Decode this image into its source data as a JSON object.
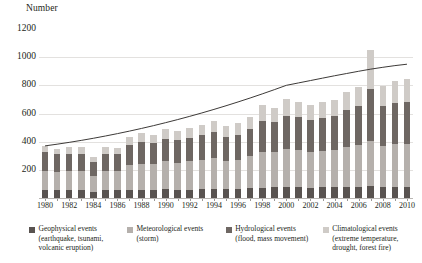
{
  "chart_data": {
    "type": "bar",
    "stacked": true,
    "title": "",
    "ylabel": "Number",
    "xlabel": "",
    "ylim": [
      0,
      1200
    ],
    "yticks": [
      200,
      400,
      600,
      800,
      1000,
      1200
    ],
    "grid": true,
    "legend_position": "bottom",
    "categories": [
      1980,
      1981,
      1982,
      1983,
      1984,
      1985,
      1986,
      1987,
      1988,
      1989,
      1990,
      1991,
      1992,
      1993,
      1994,
      1995,
      1996,
      1997,
      1998,
      1999,
      2000,
      2001,
      2002,
      2003,
      2004,
      2005,
      2006,
      2007,
      2008,
      2009,
      2010
    ],
    "xtick_labels": [
      "1980",
      "",
      "1982",
      "",
      "1984",
      "",
      "1986",
      "",
      "1988",
      "",
      "1990",
      "",
      "1992",
      "",
      "1994",
      "",
      "1996",
      "",
      "1998",
      "",
      "2000",
      "",
      "2002",
      "",
      "2004",
      "",
      "2006",
      "",
      "2008",
      "",
      "2010"
    ],
    "series": [
      {
        "name": "Geophysical events",
        "color": "#595350",
        "values": [
          60,
          55,
          55,
          55,
          45,
          55,
          55,
          60,
          55,
          60,
          65,
          60,
          60,
          65,
          65,
          65,
          65,
          70,
          70,
          75,
          75,
          75,
          70,
          75,
          75,
          80,
          80,
          85,
          80,
          80,
          80
        ]
      },
      {
        "name": "Meteorological events",
        "color": "#b5b0ac",
        "values": [
          135,
          130,
          140,
          140,
          110,
          140,
          135,
          175,
          185,
          180,
          200,
          190,
          200,
          205,
          220,
          200,
          205,
          225,
          255,
          250,
          270,
          265,
          255,
          260,
          265,
          280,
          295,
          320,
          290,
          300,
          305
        ]
      },
      {
        "name": "Hydrological events",
        "color": "#6e6763",
        "values": [
          130,
          125,
          120,
          115,
          100,
          115,
          120,
          140,
          155,
          150,
          155,
          160,
          165,
          175,
          185,
          170,
          180,
          195,
          225,
          215,
          240,
          235,
          230,
          235,
          240,
          265,
          280,
          370,
          280,
          295,
          300
        ]
      },
      {
        "name": "Climatological events",
        "color": "#cfcbc7",
        "values": [
          45,
          40,
          45,
          50,
          35,
          50,
          45,
          55,
          65,
          60,
          70,
          65,
          70,
          75,
          80,
          75,
          80,
          85,
          110,
          100,
          115,
          110,
          105,
          110,
          115,
          125,
          130,
          275,
          145,
          155,
          160
        ]
      }
    ],
    "totals": [
      370,
      350,
      360,
      360,
      290,
      360,
      355,
      430,
      460,
      450,
      490,
      475,
      495,
      520,
      550,
      510,
      530,
      575,
      660,
      640,
      700,
      685,
      660,
      680,
      695,
      750,
      785,
      1050,
      795,
      830,
      845
    ],
    "trendline": {
      "name": "trend",
      "color": "#3d3a38",
      "start_value": 370,
      "end_value": 950,
      "values": [
        370,
        382,
        395,
        409,
        424,
        440,
        457,
        475,
        494,
        514,
        535,
        557,
        580,
        604,
        629,
        655,
        682,
        710,
        739,
        769,
        800,
        817,
        834,
        851,
        868,
        884,
        900,
        915,
        928,
        940,
        950
      ]
    }
  },
  "axis": {
    "y_title": "Number"
  },
  "legend": {
    "items": [
      {
        "label": "Geophysical events\n(earthquake, tsunami,\nvolcanic eruption)",
        "color": "#595350"
      },
      {
        "label": "Meteorological events\n(storm)",
        "color": "#b5b0ac"
      },
      {
        "label": "Hydrological events\n(flood, mass movement)",
        "color": "#6e6763"
      },
      {
        "label": "Climatological events\n(extreme temperature,\ndrought, forest fire)",
        "color": "#cfcbc7"
      }
    ]
  }
}
